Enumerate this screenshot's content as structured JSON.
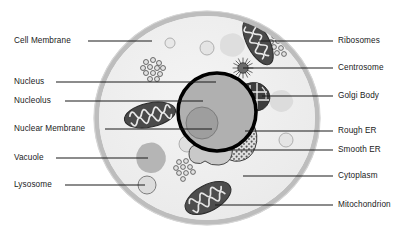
{
  "diagram": {
    "type": "labeled-biological-diagram",
    "background_color": "#ffffff",
    "colors": {
      "membrane": "#b9b9b9",
      "cytoplasm": "#efefef",
      "nucleus_ring": "#000000",
      "nucleus_fill": "#b0b0b0",
      "nucleolus": "#9a9a9a",
      "mitochondrion": "#4a4a4a",
      "golgi": "#3d3d3d",
      "vacuole": "#b5b5b5",
      "lysosome": "#dcdcdc",
      "rough_er": "#d8d8d8",
      "smooth_er": "#c8c8c8",
      "leader_line": "#1a1a1a",
      "label_text": "#1a1a1a"
    }
  },
  "labels_left": [
    {
      "id": "cell-membrane",
      "text": "Cell Membrane",
      "x": 14,
      "y": 36,
      "line_x1": 88,
      "line_x2": 152,
      "line_y": 41
    },
    {
      "id": "nucleus",
      "text": "Nucleus",
      "x": 14,
      "y": 77,
      "line_x1": 56,
      "line_x2": 216,
      "line_y": 82
    },
    {
      "id": "nucleolus",
      "text": "Nucleolus",
      "x": 14,
      "y": 96,
      "line_x1": 65,
      "line_x2": 203,
      "line_y": 101
    },
    {
      "id": "nuclear-membrane",
      "text": "Nuclear Membrane",
      "x": 14,
      "y": 124,
      "line_x1": 105,
      "line_x2": 212,
      "line_y": 129
    },
    {
      "id": "vacuole",
      "text": "Vacuole",
      "x": 14,
      "y": 153,
      "line_x1": 56,
      "line_x2": 148,
      "line_y": 158
    },
    {
      "id": "lysosome",
      "text": "Lysosome",
      "x": 14,
      "y": 180,
      "line_x1": 65,
      "line_x2": 145,
      "line_y": 185
    }
  ],
  "labels_right": [
    {
      "id": "ribosomes",
      "text": "Ribosomes",
      "x": 338,
      "y": 36,
      "line_x1": 258,
      "line_x2": 333,
      "line_y": 41
    },
    {
      "id": "centrosome",
      "text": "Centrosome",
      "x": 338,
      "y": 63,
      "line_x1": 243,
      "line_x2": 333,
      "line_y": 68
    },
    {
      "id": "golgi-body",
      "text": "Golgi Body",
      "x": 338,
      "y": 91,
      "line_x1": 262,
      "line_x2": 333,
      "line_y": 96
    },
    {
      "id": "rough-er",
      "text": "Rough ER",
      "x": 338,
      "y": 126,
      "line_x1": 245,
      "line_x2": 333,
      "line_y": 131
    },
    {
      "id": "smooth-er",
      "text": "Smooth ER",
      "x": 338,
      "y": 145,
      "line_x1": 228,
      "line_x2": 333,
      "line_y": 150
    },
    {
      "id": "cytoplasm",
      "text": "Cytoplasm",
      "x": 338,
      "y": 171,
      "line_x1": 243,
      "line_x2": 333,
      "line_y": 176
    },
    {
      "id": "mitochondrion",
      "text": "Mitochondrion",
      "x": 338,
      "y": 200,
      "line_x1": 215,
      "line_x2": 333,
      "line_y": 205
    }
  ],
  "organelles": {
    "cell_body": {
      "name": "cell-body",
      "cx": 207,
      "cy": 118,
      "rx": 113,
      "ry": 107
    },
    "nucleus": {
      "name": "nucleus",
      "cx": 217,
      "cy": 112,
      "r": 39
    },
    "nucleolus": {
      "name": "nucleolus",
      "cx": 202,
      "cy": 123,
      "r": 16
    },
    "centrosome": {
      "name": "centrosome",
      "cx": 243,
      "cy": 68,
      "r": 6
    },
    "golgi_body": {
      "name": "golgi-body",
      "cx": 256,
      "cy": 96
    },
    "rough_er": {
      "name": "rough-er",
      "cx": 245,
      "cy": 130
    },
    "smooth_er": {
      "name": "smooth-er",
      "cx": 228,
      "cy": 150
    },
    "vacuole": {
      "name": "vacuole",
      "cx": 150,
      "cy": 157
    },
    "lysosome": {
      "name": "lysosome",
      "cx": 147,
      "cy": 185,
      "r": 9
    },
    "mitochondria": [
      {
        "name": "mitochondrion-left",
        "cx": 150,
        "cy": 115,
        "rx": 26,
        "ry": 12,
        "rot": -12
      },
      {
        "name": "mitochondrion-top",
        "cx": 258,
        "cy": 42,
        "rx": 25,
        "ry": 11,
        "rot": 62
      },
      {
        "name": "mitochondrion-bottom",
        "cx": 208,
        "cy": 198,
        "rx": 25,
        "ry": 13,
        "rot": -28
      }
    ],
    "ribosome_clusters": [
      {
        "name": "ribosome-cluster-top-left",
        "cx": 153,
        "cy": 68
      },
      {
        "name": "ribosome-cluster-top-right",
        "cx": 280,
        "cy": 44
      },
      {
        "name": "ribosome-cluster-bottom-left",
        "cx": 185,
        "cy": 168
      }
    ],
    "vesicles": [
      {
        "name": "vesicle-1",
        "cx": 170,
        "cy": 43,
        "r": 5
      },
      {
        "name": "vesicle-2",
        "cx": 207,
        "cy": 48,
        "r": 7
      },
      {
        "name": "vesicle-3",
        "cx": 286,
        "cy": 140,
        "r": 7
      },
      {
        "name": "vesicle-4",
        "cx": 187,
        "cy": 144,
        "r": 8
      }
    ],
    "blobs": [
      {
        "name": "cytoplasm-blob-1",
        "cx": 233,
        "cy": 44
      },
      {
        "name": "cytoplasm-blob-2",
        "cx": 283,
        "cy": 100
      }
    ]
  }
}
